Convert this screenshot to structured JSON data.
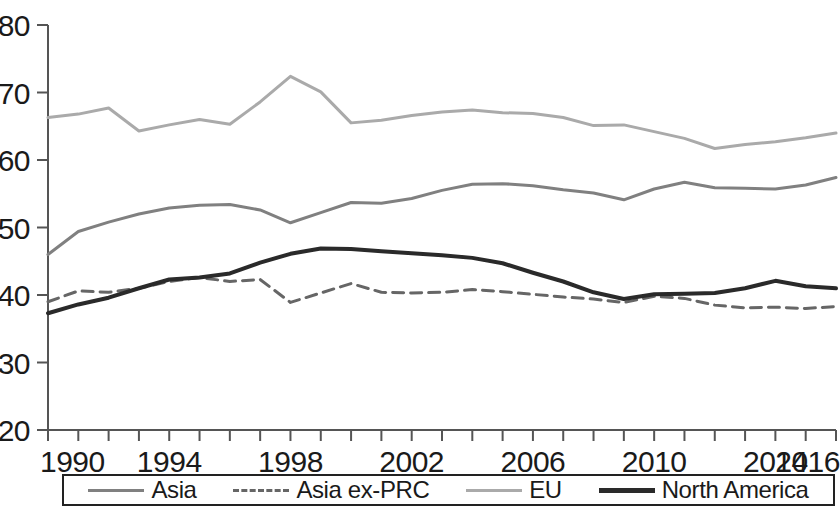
{
  "chart_data": {
    "type": "line",
    "title": "",
    "subtitle": "",
    "xlabel": "",
    "ylabel": "",
    "xlim": [
      1990,
      2016
    ],
    "ylim": [
      20,
      80
    ],
    "yticks": [
      20,
      30,
      40,
      50,
      60,
      70,
      80
    ],
    "xticks": [
      1990,
      1994,
      1998,
      2002,
      2006,
      2010,
      2014,
      2016
    ],
    "x_minor_tick_every": 1,
    "grid": false,
    "legend_position": "bottom",
    "x": [
      1990,
      1991,
      1992,
      1993,
      1994,
      1995,
      1996,
      1997,
      1998,
      1999,
      2000,
      2001,
      2002,
      2003,
      2004,
      2005,
      2006,
      2007,
      2008,
      2009,
      2010,
      2011,
      2012,
      2013,
      2014,
      2015,
      2016
    ],
    "series": [
      {
        "name": "Asia",
        "color": "#808080",
        "style": "solid",
        "width": 3,
        "values": [
          46.0,
          49.4,
          50.8,
          52.0,
          52.9,
          53.3,
          53.4,
          52.6,
          50.7,
          52.2,
          53.7,
          53.6,
          54.3,
          55.5,
          56.4,
          56.5,
          56.2,
          55.6,
          55.1,
          54.1,
          55.7,
          56.7,
          55.9,
          55.8,
          55.7,
          56.3,
          57.4
        ]
      },
      {
        "name": "Asia ex-PRC",
        "color": "#666666",
        "style": "dashed",
        "width": 3,
        "values": [
          39.0,
          40.6,
          40.4,
          41.0,
          42.0,
          42.6,
          42.0,
          42.3,
          38.9,
          40.3,
          41.7,
          40.4,
          40.3,
          40.4,
          40.8,
          40.5,
          40.1,
          39.7,
          39.4,
          38.9,
          39.8,
          39.5,
          38.5,
          38.1,
          38.2,
          38.0,
          38.3
        ]
      },
      {
        "name": "EU",
        "color": "#aaaaaa",
        "style": "solid",
        "width": 3,
        "values": [
          66.3,
          66.8,
          67.7,
          64.3,
          65.2,
          66.0,
          65.3,
          68.6,
          72.4,
          70.1,
          65.5,
          65.9,
          66.6,
          67.1,
          67.4,
          67.0,
          66.9,
          66.3,
          65.1,
          65.2,
          64.2,
          63.2,
          61.7,
          62.3,
          62.7,
          63.3,
          64.0
        ]
      },
      {
        "name": "North America",
        "color": "#2a2a2a",
        "style": "solid",
        "width": 4,
        "values": [
          37.3,
          38.6,
          39.6,
          41.0,
          42.3,
          42.6,
          43.2,
          44.8,
          46.1,
          46.9,
          46.8,
          46.5,
          46.2,
          45.9,
          45.5,
          44.7,
          43.3,
          42.0,
          40.4,
          39.4,
          40.1,
          40.2,
          40.3,
          41.0,
          42.1,
          41.3,
          41.0
        ]
      }
    ]
  },
  "axis": {
    "y_tick_labels": [
      "80",
      "70",
      "60",
      "50",
      "40",
      "30",
      "20"
    ],
    "x_tick_labels": [
      "1990",
      "1994",
      "1998",
      "2002",
      "2006",
      "2010",
      "2014",
      "2016"
    ]
  },
  "legend": {
    "entries": [
      {
        "label": "Asia",
        "color": "#808080",
        "style": "solid",
        "width": 3
      },
      {
        "label": "Asia ex-PRC",
        "color": "#666666",
        "style": "dashed",
        "width": 3
      },
      {
        "label": "EU",
        "color": "#aaaaaa",
        "style": "solid",
        "width": 3
      },
      {
        "label": "North America",
        "color": "#2a2a2a",
        "style": "solid",
        "width": 5
      }
    ]
  }
}
